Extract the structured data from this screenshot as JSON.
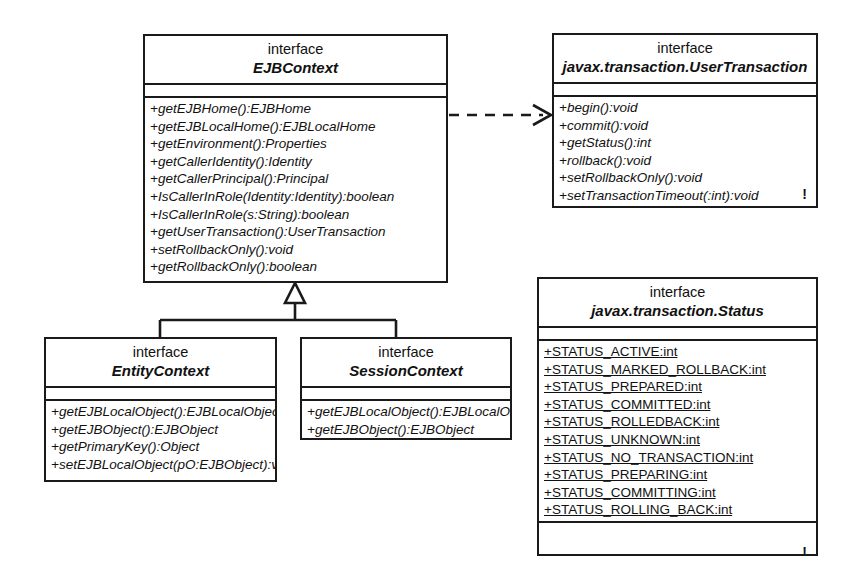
{
  "diagram": {
    "background_color": "#ffffff",
    "line_color": "#1a1a1a"
  },
  "classes": {
    "ejb_context": {
      "stereotype": "interface",
      "name": "EJBContext",
      "attributes": [],
      "operations": [
        "+getEJBHome():EJBHome",
        "+getEJBLocalHome():EJBLocalHome",
        "+getEnvironment():Properties",
        "+getCallerIdentity():Identity",
        "+getCallerPrincipal():Principal",
        "+IsCallerInRole(Identity:Identity):boolean",
        "+IsCallerInRole(s:String):boolean",
        "+getUserTransaction():UserTransaction",
        "+setRollbackOnly():void",
        "+getRollbackOnly():boolean"
      ]
    },
    "user_transaction": {
      "stereotype": "interface",
      "name": "javax.transaction.UserTransaction",
      "attributes": [],
      "operations": [
        "+begin():void",
        "+commit():void",
        "+getStatus():int",
        "+rollback():void",
        "+setRollbackOnly():void",
        "+setTransactionTimeout(:int):void"
      ],
      "marker": "!"
    },
    "status": {
      "stereotype": "interface",
      "name": "javax.transaction.Status",
      "attributes": [
        "+STATUS_ACTIVE:int",
        "+STATUS_MARKED_ROLLBACK:int",
        "+STATUS_PREPARED:int",
        "+STATUS_COMMITTED:int",
        "+STATUS_ROLLEDBACK:int",
        "+STATUS_UNKNOWN:int",
        "+STATUS_NO_TRANSACTION:int",
        "+STATUS_PREPARING:int",
        "+STATUS_COMMITTING:int",
        "+STATUS_ROLLING_BACK:int"
      ],
      "operations": [],
      "marker": "!"
    },
    "entity_context": {
      "stereotype": "interface",
      "name": "EntityContext",
      "attributes": [],
      "operations": [
        "+getEJBLocalObject():EJBLocalObject",
        "+getEJBObject():EJBObject",
        "+getPrimaryKey():Object",
        "+setEJBLocalObject(pO:EJBObject):void"
      ]
    },
    "session_context": {
      "stereotype": "interface",
      "name": "SessionContext",
      "attributes": [],
      "operations": [
        "+getEJBLocalObject():EJBLocalObject",
        "+getEJBObject():EJBObject"
      ]
    }
  },
  "relationships": [
    {
      "kind": "dependency",
      "style": "dashed",
      "arrow": "open",
      "from": "EJBContext",
      "to": "javax.transaction.UserTransaction"
    },
    {
      "kind": "generalization",
      "style": "solid",
      "arrow": "hollow-triangle",
      "from": "EntityContext",
      "to": "EJBContext"
    },
    {
      "kind": "generalization",
      "style": "solid",
      "arrow": "hollow-triangle",
      "from": "SessionContext",
      "to": "EJBContext"
    }
  ]
}
